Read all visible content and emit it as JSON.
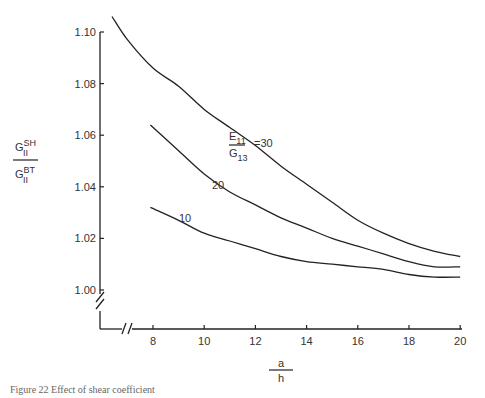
{
  "chart_data": {
    "type": "line",
    "title": "",
    "xlabel": "a/h",
    "ylabel": "G_II^SH / G_II^BT",
    "xlim": [
      6,
      20
    ],
    "ylim": [
      1.0,
      1.1
    ],
    "x_ticks": [
      "8",
      "10",
      "12",
      "14",
      "16",
      "18",
      "20"
    ],
    "y_ticks": [
      "1.00",
      "1.02",
      "1.04",
      "1.06",
      "1.08",
      "1.10"
    ],
    "axis_breaks": true,
    "grid": false,
    "legend": "inline curve labels",
    "series": [
      {
        "name": "E11/G13 = 30",
        "label": "=30",
        "points": [
          [
            6.4,
            1.106
          ],
          [
            7,
            1.097
          ],
          [
            8,
            1.086
          ],
          [
            9,
            1.079
          ],
          [
            10,
            1.07
          ],
          [
            11,
            1.063
          ],
          [
            12,
            1.056
          ],
          [
            13,
            1.048
          ],
          [
            14,
            1.041
          ],
          [
            15,
            1.034
          ],
          [
            16,
            1.027
          ],
          [
            17,
            1.022
          ],
          [
            18,
            1.018
          ],
          [
            19,
            1.015
          ],
          [
            20,
            1.013
          ]
        ]
      },
      {
        "name": "E11/G13 = 20",
        "label": "20",
        "points": [
          [
            7.9,
            1.064
          ],
          [
            9,
            1.054
          ],
          [
            10,
            1.045
          ],
          [
            11,
            1.038
          ],
          [
            12,
            1.033
          ],
          [
            13,
            1.028
          ],
          [
            14,
            1.024
          ],
          [
            15,
            1.02
          ],
          [
            16,
            1.017
          ],
          [
            17,
            1.014
          ],
          [
            18,
            1.011
          ],
          [
            19,
            1.009
          ],
          [
            20,
            1.009
          ]
        ]
      },
      {
        "name": "E11/G13 = 10",
        "label": "10",
        "points": [
          [
            7.9,
            1.032
          ],
          [
            9,
            1.027
          ],
          [
            10,
            1.022
          ],
          [
            11,
            1.019
          ],
          [
            12,
            1.016
          ],
          [
            13,
            1.013
          ],
          [
            14,
            1.011
          ],
          [
            15,
            1.01
          ],
          [
            16,
            1.009
          ],
          [
            17,
            1.008
          ],
          [
            18,
            1.006
          ],
          [
            19,
            1.005
          ],
          [
            20,
            1.005
          ]
        ]
      }
    ]
  },
  "labels": {
    "ratio_top": "E",
    "ratio_top_sub": "11",
    "ratio_bottom": "G",
    "ratio_bottom_sub": "13",
    "ratio_value": "=30",
    "curve_20": "20",
    "curve_10": "10",
    "y_num": "G",
    "y_num_sup": "SH",
    "y_num_sub": "II",
    "y_den": "G",
    "y_den_sup": "BT",
    "y_den_sub": "II",
    "x_num": "a",
    "x_den": "h"
  },
  "caption": "Figure 22   Effect of shear coefficient"
}
